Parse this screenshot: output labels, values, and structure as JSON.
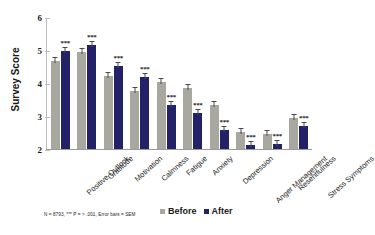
{
  "chart_data": {
    "type": "bar",
    "title": "",
    "xlabel": "",
    "ylabel": "Survey Score",
    "ylim": [
      2,
      6
    ],
    "yticks": [
      2,
      3,
      4,
      5,
      6
    ],
    "grid": false,
    "legend_position": "bottom-right",
    "categories": [
      "Positive Outlook",
      "Gratitude",
      "Motivation",
      "Calmness",
      "Fatigue",
      "Anxiety",
      "Depression",
      "Anger Management",
      "Resentfulness",
      "Stress Symptoms"
    ],
    "series": [
      {
        "name": "Before",
        "color": "#a9a8a0",
        "values": [
          4.68,
          4.95,
          4.22,
          3.75,
          4.03,
          3.85,
          3.32,
          2.52,
          2.47,
          2.95
        ]
      },
      {
        "name": "After",
        "color": "#232268",
        "values": [
          4.98,
          5.15,
          4.52,
          4.17,
          3.33,
          3.1,
          2.58,
          2.12,
          2.15,
          2.7
        ]
      }
    ],
    "significance_markers": [
      "***",
      "***",
      "***",
      "***",
      "***",
      "***",
      "***",
      "***",
      "***",
      "***"
    ],
    "error_bars": "SEM",
    "footnote": "N = 8793, *** P = > .001, Error bars = SEM"
  },
  "legend": {
    "items": [
      {
        "label": "Before",
        "color": "#a9a8a0"
      },
      {
        "label": "After",
        "color": "#232268"
      }
    ]
  },
  "axis": {
    "y_title": "Survey Score"
  }
}
